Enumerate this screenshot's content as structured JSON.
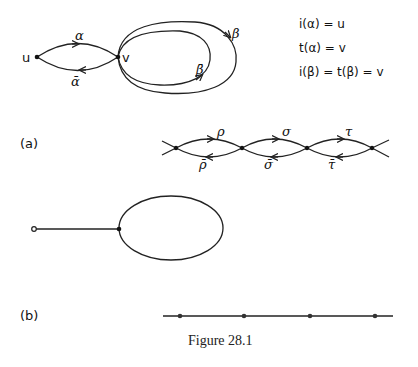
{
  "figure": {
    "caption": "Figure 28.1",
    "part_a": {
      "label": "(a)",
      "graph1": {
        "nodes": [
          {
            "id": "u",
            "label": "u"
          },
          {
            "id": "v",
            "label": "v"
          }
        ],
        "edges": [
          {
            "label": "α",
            "from": "u",
            "to": "v"
          },
          {
            "label": "ᾱ",
            "from": "v",
            "to": "u"
          },
          {
            "label": "β",
            "loop": "v"
          },
          {
            "label": "β̄",
            "loop": "v"
          }
        ]
      },
      "equations": [
        "i(α)  =  u",
        "t(α)  =  v",
        "i(β)  =  t(β)  =  v"
      ],
      "chain": {
        "forward_labels": [
          "ρ",
          "σ",
          "τ"
        ],
        "reverse_labels": [
          "ρ̄",
          "σ̄",
          "τ̄"
        ]
      }
    },
    "part_b": {
      "label": "(b)",
      "lollipop": "open vertex joined by an edge to a vertex carrying a loop",
      "line_vertices": 4
    }
  }
}
